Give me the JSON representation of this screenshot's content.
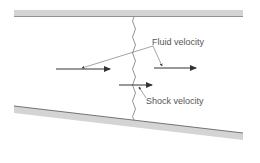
{
  "diagram": {
    "labels": {
      "fluid_velocity": "Fluid velocity",
      "shock_velocity": "Shock velocity"
    },
    "colors": {
      "wall_fill": "#d4d4d4",
      "wall_edge": "#555555",
      "line": "#333333",
      "text": "#555555"
    }
  }
}
